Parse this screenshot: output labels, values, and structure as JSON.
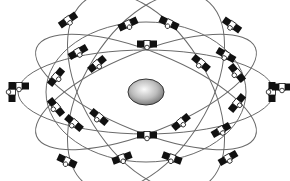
{
  "diagram": {
    "colors": {
      "background": "#ffffff",
      "orbit": "#6a6a6a",
      "satellite_panel": "#111111",
      "satellite_body": "#ffffff",
      "earth_light": "#f4f4f4",
      "earth_dark": "#7a7a7a",
      "earth_outline": "#333333"
    },
    "earth": {
      "cx": 146,
      "cy": 92,
      "rx": 18,
      "ry": 13
    },
    "orbits": [
      {
        "id": "orbit-1",
        "cx": 146,
        "cy": 92,
        "rx": 128,
        "ry": 42,
        "rotate": 0
      },
      {
        "id": "orbit-2",
        "cx": 146,
        "cy": 92,
        "rx": 118,
        "ry": 40,
        "rotate": 22
      },
      {
        "id": "orbit-3",
        "cx": 146,
        "cy": 92,
        "rx": 118,
        "ry": 40,
        "rotate": -22
      },
      {
        "id": "orbit-4",
        "cx": 146,
        "cy": 92,
        "rx": 110,
        "ry": 62,
        "rotate": 58
      },
      {
        "id": "orbit-5",
        "cx": 146,
        "cy": 92,
        "rx": 110,
        "ry": 62,
        "rotate": -58
      },
      {
        "id": "orbit-6",
        "cx": 146,
        "cy": 92,
        "rx": 100,
        "ry": 70,
        "rotate": 0
      }
    ],
    "satellites": [
      {
        "x": 12,
        "y": 92,
        "angle": 90
      },
      {
        "x": 272,
        "y": 92,
        "angle": 90
      },
      {
        "x": 147,
        "y": 44,
        "angle": 0
      },
      {
        "x": 147,
        "y": 135,
        "angle": 0
      },
      {
        "x": 68,
        "y": 20,
        "angle": -35
      },
      {
        "x": 128,
        "y": 24,
        "angle": -25
      },
      {
        "x": 169,
        "y": 23,
        "angle": 25
      },
      {
        "x": 232,
        "y": 25,
        "angle": 35
      },
      {
        "x": 19,
        "y": 86,
        "angle": 0
      },
      {
        "x": 78,
        "y": 52,
        "angle": -30
      },
      {
        "x": 97,
        "y": 64,
        "angle": -40
      },
      {
        "x": 56,
        "y": 77,
        "angle": -50
      },
      {
        "x": 201,
        "y": 63,
        "angle": 40
      },
      {
        "x": 226,
        "y": 55,
        "angle": 30
      },
      {
        "x": 237,
        "y": 73,
        "angle": 50
      },
      {
        "x": 282,
        "y": 87,
        "angle": 0
      },
      {
        "x": 56,
        "y": 107,
        "angle": 50
      },
      {
        "x": 74,
        "y": 123,
        "angle": 40
      },
      {
        "x": 99,
        "y": 117,
        "angle": 40
      },
      {
        "x": 67,
        "y": 161,
        "angle": 25
      },
      {
        "x": 122,
        "y": 158,
        "angle": -20
      },
      {
        "x": 181,
        "y": 122,
        "angle": -40
      },
      {
        "x": 221,
        "y": 130,
        "angle": -30
      },
      {
        "x": 237,
        "y": 103,
        "angle": -50
      },
      {
        "x": 172,
        "y": 158,
        "angle": 20
      },
      {
        "x": 228,
        "y": 158,
        "angle": -30
      }
    ]
  }
}
